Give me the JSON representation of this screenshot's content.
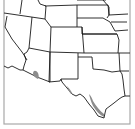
{
  "map": {
    "type": "range-map",
    "extent": "Western and South-Central United States",
    "background_color": "#ffffff",
    "boundary_color": "#1a1a1a",
    "frame_color": "#a8a8a8",
    "shaded_color": "#8c8c8c",
    "shaded_regions": [
      {
        "name": "southern-arizona-patch",
        "location": "South-central Arizona near Mexico border"
      },
      {
        "name": "south-texas-rio-grande-strip",
        "location": "Rio Grande valley, southern Texas"
      }
    ],
    "states_visible": [
      "Idaho",
      "Montana",
      "Wyoming",
      "North Dakota",
      "South Dakota",
      "Nebraska",
      "Kansas",
      "Oklahoma",
      "Texas",
      "New Mexico",
      "Colorado",
      "Utah",
      "Nevada",
      "Arizona",
      "California",
      "Minnesota",
      "Iowa",
      "Missouri",
      "Arkansas",
      "Louisiana"
    ]
  }
}
